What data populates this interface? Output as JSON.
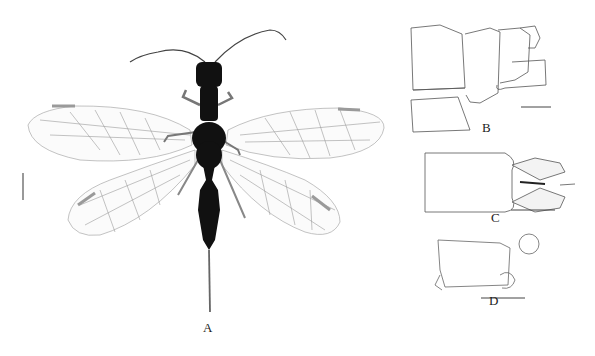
{
  "figure": {
    "panels": [
      {
        "id": "A",
        "label": "A",
        "description": "habitus, dorsal view"
      },
      {
        "id": "B",
        "label": "B",
        "description": "terminal segments, lateral view"
      },
      {
        "id": "C",
        "label": "C",
        "description": "terminal segment, ventral view"
      },
      {
        "id": "D",
        "label": "D",
        "description": "structure, lateral view"
      }
    ],
    "colors": {
      "background": "#ffffff",
      "body": "#111111",
      "wing_vein": "#8a8a8a",
      "pterostigma": "#9a9a9a",
      "line_art": "#555555"
    }
  }
}
